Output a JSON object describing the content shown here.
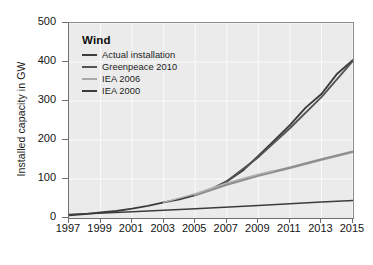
{
  "chart_data": {
    "type": "line",
    "title": "Wind",
    "xlabel": "",
    "ylabel": "Installed capacity in GW",
    "xlim": [
      1997,
      2015
    ],
    "ylim": [
      0,
      500
    ],
    "xticks": [
      "1997",
      "1999",
      "2001",
      "2003",
      "2005",
      "2007",
      "2009",
      "2011",
      "2013",
      "2015"
    ],
    "yticks": [
      "0",
      "100",
      "200",
      "300",
      "400",
      "500"
    ],
    "grid": true,
    "legend_position": "top-left-inside",
    "series": [
      {
        "name": "Actual installation",
        "color": "#3c3c3c",
        "width": 1.9,
        "x": [
          1997,
          1998,
          1999,
          2000,
          2001,
          2002,
          2003,
          2004,
          2005,
          2006,
          2007,
          2008,
          2009,
          2010,
          2011,
          2012,
          2013,
          2014,
          2015
        ],
        "values": [
          7,
          10,
          14,
          18,
          24,
          31,
          40,
          48,
          59,
          74,
          94,
          121,
          159,
          198,
          238,
          283,
          318,
          370,
          405
        ]
      },
      {
        "name": "Greenpeace 2010",
        "color": "#555555",
        "width": 1.9,
        "x": [
          2007,
          2009,
          2011,
          2013,
          2015
        ],
        "values": [
          94,
          156,
          230,
          310,
          403
        ]
      },
      {
        "name": "IEA 2006",
        "color": "#8f8f8f",
        "width": 2.6,
        "x": [
          2005,
          2007,
          2009,
          2011,
          2013,
          2015
        ],
        "values": [
          59,
          86,
          109,
          129,
          150,
          170
        ]
      },
      {
        "name": "IEA 2006 projection",
        "color": "#b4b4b4",
        "width": 1.5,
        "x": [
          2003,
          2005,
          2007,
          2009,
          2010
        ],
        "values": [
          40,
          62,
          90,
          112,
          122
        ]
      },
      {
        "name": "IEA 2000",
        "color": "#3c3c3c",
        "width": 1.5,
        "x": [
          1997,
          2001,
          2005,
          2009,
          2013,
          2015
        ],
        "values": [
          9,
          16,
          24,
          32,
          41,
          45
        ]
      }
    ],
    "legend": [
      {
        "label": "Actual installation",
        "color": "#3c3c3c"
      },
      {
        "label": "Greenpeace 2010",
        "color": "#555555"
      },
      {
        "label": "IEA 2006",
        "color": "#a8a8a8"
      },
      {
        "label": "IEA 2000",
        "color": "#3c3c3c"
      }
    ]
  },
  "style": {
    "plot_background": "#ebebeb",
    "grid_color": "#fbfbfb",
    "axis_color": "#6e6e6e",
    "text_color": "#141414"
  }
}
